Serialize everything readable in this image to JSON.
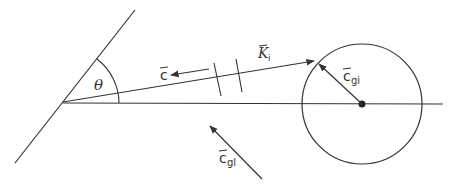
{
  "diagram": {
    "type": "vector-geometry",
    "colors": {
      "stroke": "#333333",
      "background": "#ffffff"
    },
    "labels": {
      "theta": "θ",
      "c_vec": "c",
      "k_vec": "K",
      "k_sub": "i",
      "cgi_vec": "c",
      "cgi_sub": "gi",
      "cgl_vec": "c",
      "cgl_sub": "gl"
    },
    "elements": [
      {
        "id": "slanted-line",
        "from": [
          15,
          163
        ],
        "to": [
          135,
          10
        ]
      },
      {
        "id": "horizontal-axis",
        "from": [
          63,
          103
        ],
        "to": [
          443,
          104
        ]
      },
      {
        "id": "k-vector",
        "from": [
          63,
          102
        ],
        "to": [
          316,
          61
        ],
        "label": "K_i"
      },
      {
        "id": "circle",
        "center": [
          362,
          104
        ],
        "radius": 60
      },
      {
        "id": "cgi-vector",
        "from": [
          362,
          104
        ],
        "to": [
          318,
          63
        ],
        "label": "c_gi"
      },
      {
        "id": "c-arrow",
        "from": [
          209,
          69
        ],
        "to": [
          170,
          75
        ],
        "label": "c"
      },
      {
        "id": "cgl-arrow",
        "from": [
          262,
          179
        ],
        "to": [
          209,
          125
        ],
        "label": "c_gl"
      },
      {
        "id": "angle-arc",
        "vertex": [
          63,
          102
        ],
        "radius": 56,
        "label": "θ"
      }
    ]
  }
}
